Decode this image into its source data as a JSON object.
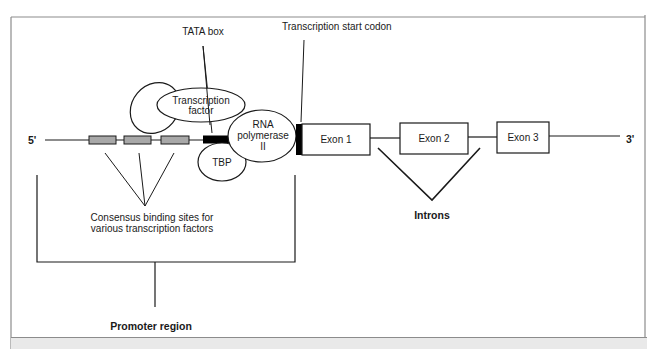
{
  "figure": {
    "labels": {
      "tata_box": "TATA box",
      "transcription_start_codon": "Transcription start codon",
      "transcription_factor_line1": "Transcription",
      "transcription_factor_line2": "factor",
      "rna_pol_line1": "RNA",
      "rna_pol_line2": "polymerase",
      "rna_pol_line3": "II",
      "tbp": "TBP",
      "five_prime": "5'",
      "three_prime": "3'",
      "exons": [
        "Exon 1",
        "Exon 2",
        "Exon 3"
      ],
      "consensus_line1": "Consensus binding sites for",
      "consensus_line2": "various transcription factors",
      "introns": "Introns",
      "promoter_region": "Promoter region"
    },
    "colors": {
      "line": "#1a1a1a",
      "binding_site_fill": "#a8a8a8",
      "tata_fill": "#000000",
      "frame": "#8c8c8c",
      "caption_bg": "#e9e9e9"
    }
  },
  "caption": {
    "text": "...indicates the TATA box and... (clipped)"
  }
}
